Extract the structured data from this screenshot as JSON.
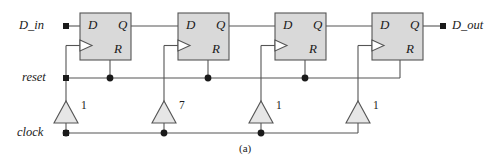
{
  "figure": {
    "caption": "(a)",
    "type": "digital-logic-schematic"
  },
  "colors": {
    "wire": "#555555",
    "box_fill": "#d9d9d9",
    "box_stroke": "#555555",
    "text": "#1a1a1a",
    "node": "#1a1a1a",
    "background": "#ffffff"
  },
  "signals": {
    "input": "D_in",
    "output": "D_out",
    "reset": "reset",
    "clock": "clock"
  },
  "flipflops": [
    {
      "id": "ff1",
      "d": "D",
      "q": "Q",
      "r": "R",
      "clk": "clk-triangle"
    },
    {
      "id": "ff2",
      "d": "D",
      "q": "Q",
      "r": "R",
      "clk": "clk-triangle"
    },
    {
      "id": "ff3",
      "d": "D",
      "q": "Q",
      "r": "R",
      "clk": "clk-triangle"
    },
    {
      "id": "ff4",
      "d": "D",
      "q": "Q",
      "r": "R",
      "clk": "clk-triangle"
    }
  ],
  "buffers": [
    {
      "id": "buf1",
      "label": "1"
    },
    {
      "id": "buf2",
      "label": "7"
    },
    {
      "id": "buf3",
      "label": "1"
    },
    {
      "id": "buf4",
      "label": "1"
    }
  ]
}
